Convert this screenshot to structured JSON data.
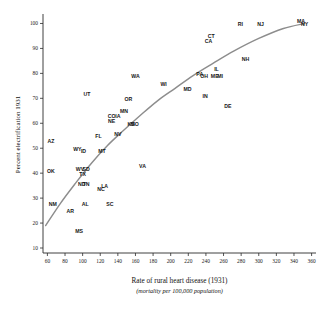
{
  "chart_data": {
    "type": "scatter",
    "title": "",
    "xlabel": "Rate of rural heart disease (1931)",
    "xlabel_sub": "(mortality per 100,000 population)",
    "ylabel": "Percent electrification 1931",
    "xlim": [
      55,
      365
    ],
    "ylim": [
      8,
      103
    ],
    "xticks": [
      60,
      80,
      100,
      120,
      140,
      160,
      180,
      200,
      220,
      240,
      260,
      280,
      300,
      320,
      340,
      360
    ],
    "yticks": [
      10,
      20,
      30,
      40,
      50,
      60,
      70,
      80,
      90,
      100
    ],
    "grid": false,
    "legend": "none",
    "point_style": "text-label-only",
    "points": [
      {
        "label": "MS",
        "x": 96,
        "y": 16
      },
      {
        "label": "AR",
        "x": 86,
        "y": 24
      },
      {
        "label": "NM",
        "x": 66,
        "y": 27
      },
      {
        "label": "AL",
        "x": 103,
        "y": 27
      },
      {
        "label": "SC",
        "x": 131,
        "y": 27
      },
      {
        "label": "NC",
        "x": 121,
        "y": 33
      },
      {
        "label": "LA",
        "x": 125,
        "y": 34
      },
      {
        "label": "ND",
        "x": 99,
        "y": 35
      },
      {
        "label": "TN",
        "x": 104,
        "y": 35
      },
      {
        "label": "TX",
        "x": 100,
        "y": 39
      },
      {
        "label": "OK",
        "x": 64,
        "y": 40
      },
      {
        "label": "WV",
        "x": 97,
        "y": 41
      },
      {
        "label": "SD",
        "x": 104,
        "y": 41
      },
      {
        "label": "VA",
        "x": 168,
        "y": 42
      },
      {
        "label": "ID",
        "x": 101,
        "y": 48
      },
      {
        "label": "MT",
        "x": 122,
        "y": 48
      },
      {
        "label": "WY",
        "x": 94,
        "y": 49
      },
      {
        "label": "AZ",
        "x": 64,
        "y": 52
      },
      {
        "label": "FL",
        "x": 118,
        "y": 54
      },
      {
        "label": "NV",
        "x": 140,
        "y": 55
      },
      {
        "label": "MO",
        "x": 159,
        "y": 59
      },
      {
        "label": "KS",
        "x": 155,
        "y": 59
      },
      {
        "label": "NE",
        "x": 133,
        "y": 60
      },
      {
        "label": "CO",
        "x": 133,
        "y": 62
      },
      {
        "label": "IA",
        "x": 140,
        "y": 62
      },
      {
        "label": "MN",
        "x": 147,
        "y": 64
      },
      {
        "label": "DE",
        "x": 265,
        "y": 66
      },
      {
        "label": "OR",
        "x": 152,
        "y": 69
      },
      {
        "label": "IN",
        "x": 239,
        "y": 70
      },
      {
        "label": "UT",
        "x": 105,
        "y": 71
      },
      {
        "label": "MD",
        "x": 219,
        "y": 73
      },
      {
        "label": "WI",
        "x": 192,
        "y": 75
      },
      {
        "label": "WA",
        "x": 160,
        "y": 78
      },
      {
        "label": "ME",
        "x": 250,
        "y": 78
      },
      {
        "label": "MI",
        "x": 256,
        "y": 78
      },
      {
        "label": "PA",
        "x": 233,
        "y": 79
      },
      {
        "label": "OH",
        "x": 238,
        "y": 78
      },
      {
        "label": "IL",
        "x": 252,
        "y": 81
      },
      {
        "label": "NH",
        "x": 285,
        "y": 85
      },
      {
        "label": "CA",
        "x": 243,
        "y": 92
      },
      {
        "label": "CT",
        "x": 246,
        "y": 94
      },
      {
        "label": "RI",
        "x": 279,
        "y": 99
      },
      {
        "label": "NJ",
        "x": 302,
        "y": 99
      },
      {
        "label": "MA",
        "x": 348,
        "y": 100
      },
      {
        "label": "NY",
        "x": 352,
        "y": 99
      }
    ],
    "fit_curve": {
      "description": "smooth increasing trend line",
      "points": [
        {
          "x": 58,
          "y": 19
        },
        {
          "x": 75,
          "y": 28
        },
        {
          "x": 92,
          "y": 36
        },
        {
          "x": 110,
          "y": 44
        },
        {
          "x": 128,
          "y": 51
        },
        {
          "x": 146,
          "y": 57
        },
        {
          "x": 165,
          "y": 63
        },
        {
          "x": 185,
          "y": 69
        },
        {
          "x": 205,
          "y": 74
        },
        {
          "x": 225,
          "y": 79
        },
        {
          "x": 248,
          "y": 84
        },
        {
          "x": 272,
          "y": 89
        },
        {
          "x": 300,
          "y": 94
        },
        {
          "x": 328,
          "y": 98
        },
        {
          "x": 352,
          "y": 100
        }
      ]
    }
  }
}
